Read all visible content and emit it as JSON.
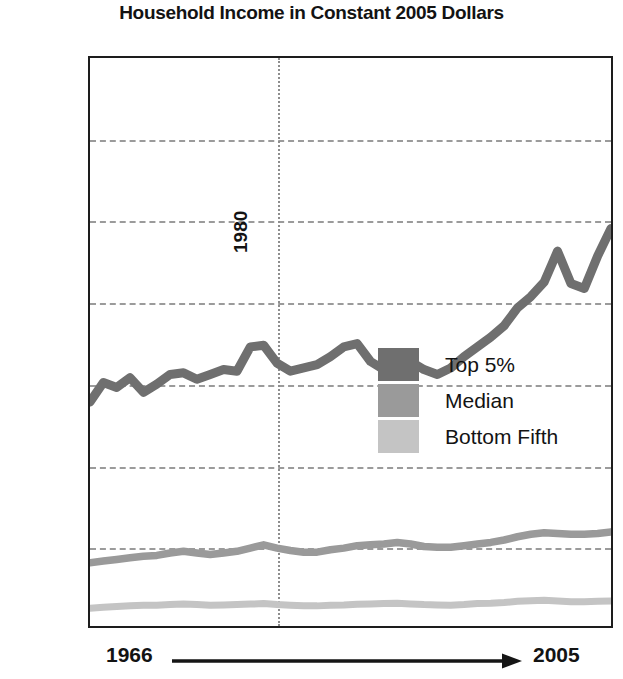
{
  "chart_data": {
    "type": "line",
    "title": "Household Income in Constant 2005 Dollars",
    "xlabel": "",
    "ylabel": "",
    "grid": true,
    "legend_position": "center-right",
    "xlim": [
      1966,
      2005
    ],
    "ylim": [
      0,
      350000
    ],
    "x_start_label": "1966",
    "x_end_label": "2005",
    "y_tick_labels": [
      "$350K",
      "$300K",
      "$250K",
      "$200K",
      "$150K",
      "$100K",
      "$50K",
      "0"
    ],
    "y_tick_values": [
      350000,
      300000,
      250000,
      200000,
      150000,
      100000,
      50000,
      0
    ],
    "annotations": [
      {
        "name": "1980-marker",
        "label": "1980",
        "x": 1980,
        "orientation": "vertical"
      }
    ],
    "x": [
      1966,
      1967,
      1968,
      1969,
      1970,
      1971,
      1972,
      1973,
      1974,
      1975,
      1976,
      1977,
      1978,
      1979,
      1980,
      1981,
      1982,
      1983,
      1984,
      1985,
      1986,
      1987,
      1988,
      1989,
      1990,
      1991,
      1992,
      1993,
      1994,
      1995,
      1996,
      1997,
      1998,
      1999,
      2000,
      2001,
      2002,
      2003,
      2004,
      2005
    ],
    "series": [
      {
        "name": "Top 5%",
        "color": "#6f6f6f",
        "values": [
          138000,
          150000,
          147000,
          153000,
          144000,
          149000,
          155000,
          156000,
          152000,
          155000,
          158000,
          157000,
          172000,
          173000,
          162000,
          157000,
          159000,
          161000,
          166000,
          172000,
          174000,
          163000,
          158000,
          160000,
          163000,
          158000,
          155000,
          159000,
          166000,
          172000,
          178000,
          185000,
          196000,
          203000,
          212000,
          231000,
          211000,
          208000,
          228000,
          245000
        ]
      },
      {
        "name": "Median",
        "color": "#9a9a9a",
        "values": [
          39000,
          40000,
          41000,
          42000,
          43000,
          43500,
          45000,
          46000,
          45000,
          44000,
          45000,
          46000,
          48000,
          50000,
          48000,
          46500,
          45500,
          45500,
          47000,
          48000,
          49500,
          50000,
          50500,
          51500,
          50500,
          49000,
          48500,
          48500,
          49500,
          50500,
          51500,
          53000,
          55000,
          56500,
          57500,
          57000,
          56500,
          56500,
          57000,
          58000
        ]
      },
      {
        "name": "Bottom Fifth",
        "color": "#c4c4c4",
        "values": [
          11000,
          11500,
          12000,
          12500,
          12800,
          12800,
          13200,
          13500,
          13200,
          12800,
          13000,
          13200,
          13500,
          13800,
          13200,
          12800,
          12500,
          12400,
          12800,
          13000,
          13400,
          13600,
          13800,
          14000,
          13600,
          13200,
          13000,
          12800,
          13200,
          13800,
          14000,
          14500,
          15200,
          15600,
          15800,
          15400,
          15000,
          15000,
          15200,
          15400
        ]
      }
    ]
  },
  "legend": {
    "items": [
      {
        "label": "Top 5%",
        "color": "#6f6f6f"
      },
      {
        "label": "Median",
        "color": "#9a9a9a"
      },
      {
        "label": "Bottom Fifth",
        "color": "#c4c4c4"
      }
    ]
  }
}
